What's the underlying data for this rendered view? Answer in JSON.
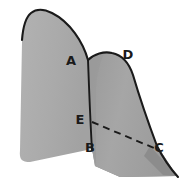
{
  "figure": {
    "background_color": "#ffffff",
    "outline_color": "#1a1a1a",
    "fill_light": "#ababab",
    "fill_mid": "#9d9d9d",
    "fill_dark": "#8a8a8a",
    "fill_shadow": "#7e7e7e",
    "labels": [
      {
        "id": "A",
        "text": "A",
        "x": 71,
        "y": 65
      },
      {
        "id": "D",
        "text": "D",
        "x": 128,
        "y": 59
      },
      {
        "id": "E",
        "text": "E",
        "x": 80,
        "y": 124
      },
      {
        "id": "B",
        "text": "B",
        "x": 90,
        "y": 152
      },
      {
        "id": "C",
        "text": "C",
        "x": 159,
        "y": 152
      }
    ],
    "shapes": {
      "left_hill_path": "M 20 150 C 19 160 22 162 30 162 L 92 149 L 90 120 L 88 82 L 88 60 C 83 42 70 22 52 13 C 44 9 36 9 31 13 C 26 17 23 28 22 42 Z",
      "right_hill_path": "M 88 60 C 94 54 104 51 112 53 C 122 55 129 63 133 75 C 138 92 148 122 158 147 L 176 176 L 120 176 L 95 165 L 92 149 Z",
      "right_hill_shade_path": "M 88 60 C 92 56 98 53 104 52 C 99 60 96 72 95 86 L 95 165 L 92 149 L 90 120 Z",
      "ground_shadow_path": "M 92 149 L 158 147 L 176 176 L 122 176 L 96 166 Z",
      "tail_path": "M 152 148 L 176 176 L 160 174 L 146 158 Z",
      "outline_left_top": "M 22 40 C 23 27 26 17 31 13 C 36 9 44 9 52 13 C 70 22 83 42 88 60",
      "outline_right_top": "M 88 60 C 94 54 104 51 112 53 C 122 55 129 63 133 75 C 138 92 148 122 158 147",
      "outline_tail": "M 158 147 C 163 157 170 167 177 176",
      "ridge_line": "M 88 60 C 89 85 90 115 92 149",
      "dashed_line": "M 92 122 L 153 148"
    },
    "dashed_pattern": "7 5",
    "stroke_widths": {
      "outline": 2.1,
      "ridge": 1.9,
      "dashed": 1.9
    }
  }
}
